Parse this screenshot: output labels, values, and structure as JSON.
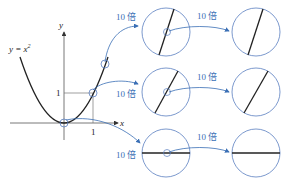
{
  "figure": {
    "curve_label": "y = x²",
    "curve_label_base": "y = x",
    "curve_label_exp": "2",
    "axis_x_label": "x",
    "axis_y_label": "y",
    "tick_x": "1",
    "tick_y": "1",
    "zoom_label": "10 倍",
    "rows": [
      {
        "name": "steep-point",
        "first_zoom": "10 倍",
        "second_zoom": "10 倍"
      },
      {
        "name": "point-1-1",
        "first_zoom": "10 倍",
        "second_zoom": "10 倍"
      },
      {
        "name": "origin",
        "first_zoom": "10 倍",
        "second_zoom": "10 倍"
      }
    ],
    "colors": {
      "curve": "#222222",
      "axis": "#555555",
      "circle": "#5a7fc0",
      "arrow": "#3a6fb5",
      "label": "#3a6fb5"
    }
  }
}
